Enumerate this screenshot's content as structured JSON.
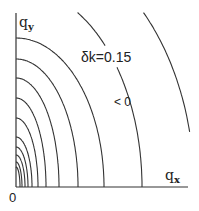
{
  "figure": {
    "type": "contour-plot",
    "axes": {
      "x_label_main": "q",
      "x_label_sub": "x",
      "y_label_main": "q",
      "y_label_sub": "y",
      "origin_label": "0"
    },
    "annotations": {
      "contour_value": "δk=0.15",
      "region_sign": "< 0"
    },
    "colors": {
      "line": "#333333",
      "background": "#ffffff"
    }
  },
  "chart_data": {
    "type": "contour",
    "title": "",
    "xlabel": "q_x",
    "ylabel": "q_y",
    "origin": "0",
    "annotations": [
      "δk=0.15",
      "< 0"
    ],
    "contours_pixel_radii": [
      {
        "rx": 4,
        "ry": 20
      },
      {
        "rx": 6,
        "ry": 25
      },
      {
        "rx": 9,
        "ry": 32
      },
      {
        "rx": 12,
        "ry": 40
      },
      {
        "rx": 16,
        "ry": 50
      },
      {
        "rx": 22,
        "ry": 69
      },
      {
        "rx": 30,
        "ry": 89
      },
      {
        "rx": 43,
        "ry": 109
      },
      {
        "rx": 62,
        "ry": 128
      },
      {
        "rx": 88,
        "ry": 149
      },
      {
        "rx": 126,
        "ry": 200,
        "label": "δk=0.15"
      },
      {
        "rx": 178,
        "ry": 250
      }
    ],
    "grid": false,
    "legend": null
  }
}
